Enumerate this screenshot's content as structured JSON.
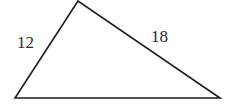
{
  "diagram": {
    "type": "triangle",
    "vertices": {
      "top": [
        78,
        1
      ],
      "bottom_left": [
        15,
        98
      ],
      "bottom_right": [
        220,
        98
      ]
    },
    "side_labels": {
      "left": "12",
      "right": "18",
      "bottom": ""
    },
    "stroke_color": "#1e1e1e"
  }
}
